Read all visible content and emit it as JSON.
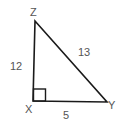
{
  "diagram": {
    "type": "right-triangle",
    "vertices": {
      "Z": {
        "label": "Z",
        "position": "top"
      },
      "X": {
        "label": "X",
        "position": "bottom-left",
        "right_angle": true
      },
      "Y": {
        "label": "Y",
        "position": "bottom-right"
      }
    },
    "sides": {
      "XZ": {
        "label": "12"
      },
      "XY": {
        "label": "5"
      },
      "ZY": {
        "label": "13"
      }
    },
    "colors": {
      "stroke": "#1a1a1a",
      "text": "#555555"
    }
  }
}
